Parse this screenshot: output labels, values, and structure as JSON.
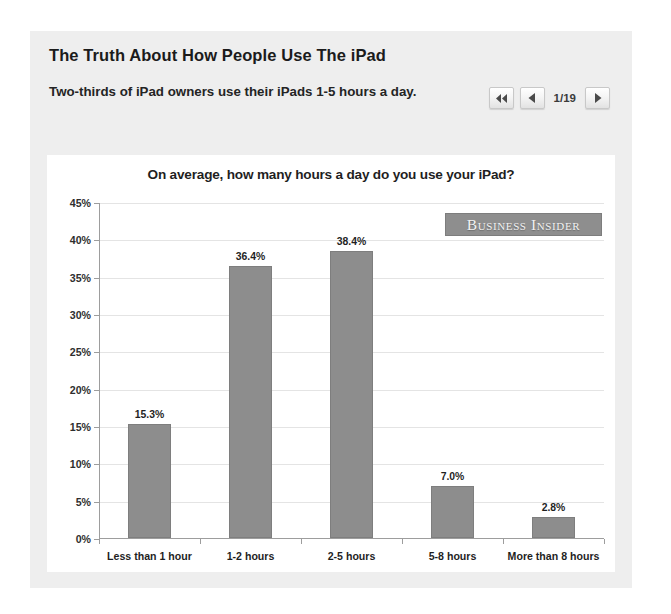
{
  "article": {
    "headline": "The Truth About How People Use The iPad",
    "subheadline": "Two-thirds of iPad owners use their iPads 1-5 hours a day."
  },
  "pager": {
    "first_icon": "double-chevron-left-icon",
    "prev_icon": "chevron-left-icon",
    "next_icon": "chevron-right-icon",
    "position": "1/19",
    "current_page": 1,
    "total_pages": 19
  },
  "watermark": {
    "text": "Business Insider",
    "background": "#8e8e8e",
    "color": "#f2f2f2"
  },
  "chart_data": {
    "type": "bar",
    "title": "On average, how many hours a day do you use your iPad?",
    "xlabel": "",
    "ylabel": "",
    "categories": [
      "Less than 1 hour",
      "1-2 hours",
      "2-5 hours",
      "5-8 hours",
      "More than 8 hours"
    ],
    "values": [
      15.3,
      36.4,
      38.4,
      7.0,
      2.8
    ],
    "value_labels": [
      "15.3%",
      "36.4%",
      "38.4%",
      "7.0%",
      "2.8%"
    ],
    "ylim": [
      0,
      45
    ],
    "ytick_values": [
      0,
      5,
      10,
      15,
      20,
      25,
      30,
      35,
      40,
      45
    ],
    "ytick_labels": [
      "0%",
      "5%",
      "10%",
      "15%",
      "20%",
      "25%",
      "30%",
      "35%",
      "40%",
      "45%"
    ],
    "grid": true,
    "legend": false,
    "bar_color": "#8d8d8d",
    "background": "#ffffff"
  }
}
